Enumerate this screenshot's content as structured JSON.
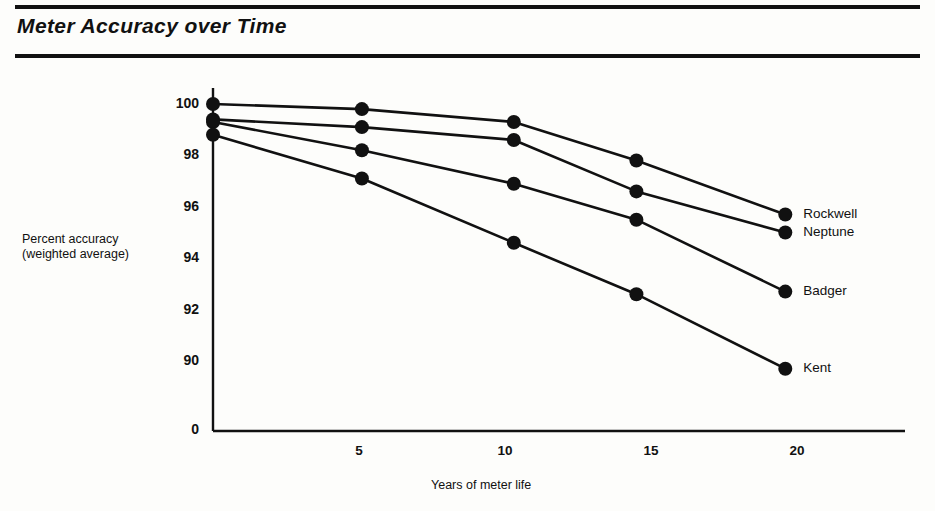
{
  "header": {
    "title": "Meter Accuracy over Time"
  },
  "chart_data": {
    "type": "line",
    "title": "Meter Accuracy over Time",
    "xlabel": "Years of meter life",
    "ylabel": "Percent accuracy (weighted average)",
    "ylabel_line1": "Percent accuracy",
    "ylabel_line2": "(weighted average)",
    "xlim": [
      0,
      20.6
    ],
    "ylim": [
      88.6,
      100.3
    ],
    "grid": false,
    "legend_position": "right-inline-end-of-line",
    "xticks": [
      5,
      10,
      15,
      20
    ],
    "xtick_labels": [
      "5",
      "10",
      "15",
      "20"
    ],
    "yticks": [
      90,
      92,
      94,
      96,
      98,
      100
    ],
    "ytick_labels": [
      "100",
      "98",
      "96",
      "94",
      "92",
      "90"
    ],
    "y_origin_label": "0",
    "axis_note": "y-axis is broken: a 0 label sits below the 90 tick",
    "x": [
      0,
      5.1,
      10.3,
      14.5,
      19.6
    ],
    "series": [
      {
        "name": "Rockwell",
        "label": "Rockwell",
        "values": [
          100.0,
          99.8,
          99.3,
          97.8,
          95.7
        ]
      },
      {
        "name": "Neptune",
        "label": "Neptune",
        "values": [
          99.4,
          99.1,
          98.6,
          96.6,
          95.0
        ]
      },
      {
        "name": "Badger",
        "label": "Badger",
        "values": [
          99.3,
          98.2,
          96.9,
          95.5,
          92.7
        ]
      },
      {
        "name": "Kent",
        "label": "Kent",
        "values": [
          98.8,
          97.1,
          94.6,
          92.6,
          89.7
        ]
      }
    ]
  },
  "style": {
    "ink": "#111111",
    "paper": "#fdfdfb"
  }
}
